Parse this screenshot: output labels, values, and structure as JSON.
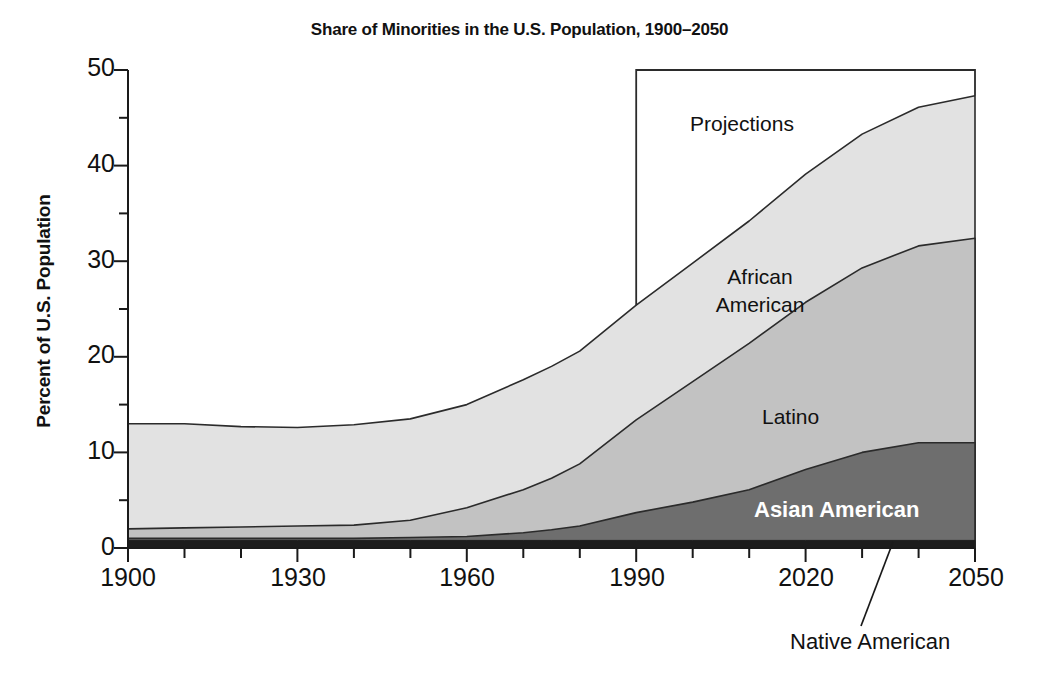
{
  "chart_data": {
    "type": "area",
    "title": "Share of Minorities in the U.S. Population, 1900–2050",
    "xlabel": "",
    "ylabel": "Percent of U.S. Population",
    "xlim": [
      1900,
      2050
    ],
    "ylim": [
      0,
      50
    ],
    "grid": false,
    "legend_position": "inline-labels",
    "stacked": true,
    "x_major_ticks": [
      1900,
      1930,
      1960,
      1990,
      2020,
      2050
    ],
    "x_minor_tick_step": 10,
    "y_major_ticks": [
      0,
      10,
      20,
      30,
      40,
      50
    ],
    "y_minor_tick_step": 5,
    "x": [
      1900,
      1910,
      1920,
      1930,
      1940,
      1950,
      1960,
      1970,
      1975,
      1980,
      1990,
      2000,
      2010,
      2020,
      2030,
      2040,
      2050
    ],
    "series": [
      {
        "name": "Native American",
        "order": 1,
        "color": "#1c1c1c",
        "values": [
          0.8,
          0.8,
          0.8,
          0.8,
          0.8,
          0.8,
          0.8,
          0.8,
          0.8,
          0.8,
          0.8,
          0.8,
          0.8,
          0.8,
          0.8,
          0.8,
          0.8
        ]
      },
      {
        "name": "Asian American",
        "order": 2,
        "color": "#6e6e6e",
        "values": [
          0.2,
          0.2,
          0.2,
          0.2,
          0.2,
          0.3,
          0.4,
          0.8,
          1.1,
          1.5,
          2.9,
          4.0,
          5.3,
          7.4,
          9.2,
          10.2,
          10.2
        ]
      },
      {
        "name": "Latino",
        "order": 3,
        "color": "#c2c2c2",
        "values": [
          1.0,
          1.1,
          1.2,
          1.3,
          1.4,
          1.8,
          3.0,
          4.5,
          5.4,
          6.5,
          9.7,
          12.6,
          15.3,
          17.5,
          19.3,
          20.6,
          21.4
        ]
      },
      {
        "name": "African American",
        "order": 4,
        "color": "#e2e2e2",
        "values": [
          11.0,
          10.9,
          10.5,
          10.3,
          10.5,
          10.6,
          10.8,
          11.5,
          11.7,
          11.8,
          12.0,
          12.4,
          12.8,
          13.4,
          14.0,
          14.5,
          14.9
        ]
      }
    ],
    "stack_tops": {
      "native_american": [
        0.8,
        0.8,
        0.8,
        0.8,
        0.8,
        0.8,
        0.8,
        0.8,
        0.8,
        0.8,
        0.8,
        0.8,
        0.8,
        0.8,
        0.8,
        0.8,
        0.8
      ],
      "asian_american": [
        1.0,
        1.0,
        1.0,
        1.0,
        1.0,
        1.1,
        1.2,
        1.6,
        1.9,
        2.3,
        3.7,
        4.8,
        6.1,
        8.2,
        10.0,
        11.0,
        11.0
      ],
      "latino": [
        2.0,
        2.1,
        2.2,
        2.3,
        2.4,
        2.9,
        4.2,
        6.1,
        7.3,
        8.8,
        13.4,
        17.4,
        21.4,
        25.7,
        29.3,
        31.6,
        32.4
      ],
      "african_american": [
        13.0,
        13.0,
        12.7,
        12.6,
        12.9,
        13.5,
        15.0,
        17.6,
        19.0,
        20.6,
        25.4,
        29.8,
        34.2,
        39.1,
        43.3,
        46.1,
        47.3
      ]
    },
    "annotations": [
      {
        "name": "projections-box",
        "label": "Projections",
        "x_start": 1990,
        "x_end": 2050,
        "y_top": 50
      },
      {
        "name": "native-american-leader-line",
        "label": "Native American"
      }
    ]
  },
  "labels": {
    "title": "Share of Minorities in the U.S. Population, 1900–2050",
    "y_axis": "Percent of U.S. Population",
    "y_ticks": [
      "0",
      "10",
      "20",
      "30",
      "40",
      "50"
    ],
    "x_ticks": [
      "1900",
      "1930",
      "1960",
      "1990",
      "2020",
      "2050"
    ],
    "projections": "Projections",
    "african_american_line1": "African",
    "african_american_line2": "American",
    "latino": "Latino",
    "asian_american": "Asian American",
    "native_american": "Native American"
  }
}
